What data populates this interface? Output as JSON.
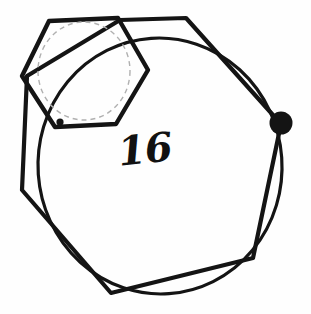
{
  "figure": {
    "title_label": "16",
    "background_color": "#fefefe",
    "stroke_color": "#141414",
    "dashed_stroke_color": "#b0b0b0",
    "marker_fill_color": "#141414",
    "canvas": {
      "width": 311,
      "height": 314
    },
    "shapes": {
      "large_circle": {
        "name": "large-circle",
        "type": "ellipse",
        "cx": 160,
        "cy": 166,
        "rx": 122,
        "ry": 128,
        "rotation": -4,
        "stroke_width": 3.2,
        "fill": "none"
      },
      "outer_polygon": {
        "name": "outer-polygon",
        "type": "polygon",
        "sides": 7,
        "stroke_width": 4.2,
        "fill": "none",
        "points": [
          [
            186,
            18
          ],
          [
            281,
            124
          ],
          [
            253,
            258
          ],
          [
            111,
            293
          ],
          [
            22,
            190
          ],
          [
            27,
            76
          ],
          [
            120,
            20
          ]
        ]
      },
      "small_hexagon": {
        "name": "small-hexagon",
        "type": "polygon",
        "sides": 6,
        "stroke_width": 4.4,
        "fill": "none",
        "points": [
          [
            49,
            21
          ],
          [
            118,
            18
          ],
          [
            148,
            70
          ],
          [
            116,
            124
          ],
          [
            55,
            127
          ],
          [
            22,
            76
          ]
        ]
      },
      "dashed_circle": {
        "name": "dashed-inscribed-circle",
        "type": "ellipse",
        "cx": 84,
        "cy": 71,
        "rx": 46,
        "ry": 49,
        "stroke_width": 1.4,
        "dash_pattern": "5 4",
        "fill": "none"
      },
      "vertex_marker_large": {
        "name": "vertex-marker-large",
        "type": "circle",
        "cx": 281,
        "cy": 123,
        "r": 11.5
      },
      "vertex_marker_small": {
        "name": "vertex-marker-small",
        "type": "circle",
        "cx": 60,
        "cy": 122,
        "r": 3.6
      }
    }
  }
}
